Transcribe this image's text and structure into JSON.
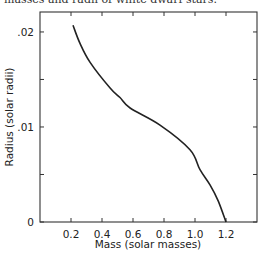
{
  "caption": "masses and radii of white dwarf stars.",
  "chart_data": {
    "type": "line",
    "title": "",
    "xlabel": "Mass (solar masses)",
    "ylabel": "Radius (solar radii)",
    "xlim": [
      0,
      1.4
    ],
    "ylim": [
      0,
      0.0221
    ],
    "x_ticks": [
      0.2,
      0.4,
      0.6,
      0.8,
      1.0,
      1.2
    ],
    "x_tick_labels": [
      "0.2",
      "0.4",
      "0.6",
      "0.8",
      "1.0",
      "1.2"
    ],
    "y_ticks": [
      0,
      0.01,
      0.02
    ],
    "y_tick_labels": [
      "0",
      ".01",
      ".02"
    ],
    "y_minor_ticks": [
      0.005,
      0.015
    ],
    "grid": false,
    "legend": null,
    "series": [
      {
        "name": "White dwarf mass-radius relation",
        "x": [
          0.213,
          0.258,
          0.323,
          0.452,
          0.516,
          0.581,
          0.774,
          0.968,
          1.032,
          1.097,
          1.15,
          1.2
        ],
        "y": [
          0.0207,
          0.0188,
          0.0168,
          0.0141,
          0.0131,
          0.012,
          0.0102,
          0.0076,
          0.0055,
          0.0039,
          0.0022,
          0.0
        ]
      }
    ]
  }
}
